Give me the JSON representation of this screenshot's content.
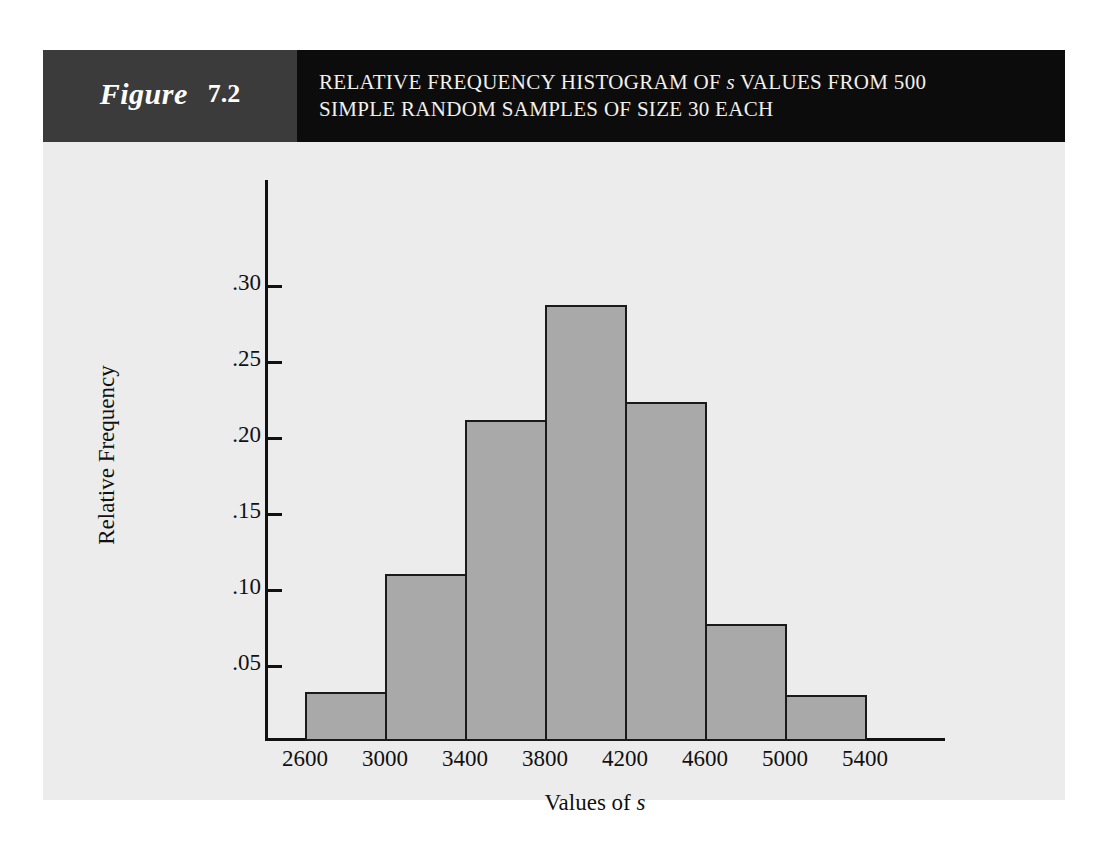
{
  "figure": {
    "label_word": "Figure",
    "number": "7.2",
    "title_line1_pre": "RELATIVE FREQUENCY HISTOGRAM OF ",
    "title_line1_em": "s",
    "title_line1_post": " VALUES FROM 500",
    "title_line2": "SIMPLE RANDOM SAMPLES OF SIZE 30 EACH"
  },
  "colors": {
    "panel_bg": "#ececec",
    "label_block": "#3c3b3b",
    "title_block": "#0d0c0c",
    "bar_fill": "#a9a9a9",
    "bar_stroke": "#1a1a1a",
    "axis": "#111111"
  },
  "axis_titles": {
    "y": "Relative Frequency",
    "x_pre": "Values of ",
    "x_em": "s"
  },
  "chart_data": {
    "type": "bar",
    "title": "RELATIVE FREQUENCY HISTOGRAM OF s VALUES FROM 500 SIMPLE RANDOM SAMPLES OF SIZE 30 EACH",
    "xlabel": "Values of s",
    "ylabel": "Relative Frequency",
    "histogram": true,
    "bin_width": 400,
    "bin_edges": [
      2600,
      3000,
      3400,
      3800,
      4200,
      4600,
      5000,
      5400
    ],
    "categories": [
      "2600-3000",
      "3000-3400",
      "3400-3800",
      "3800-4200",
      "4200-4600",
      "4600-5000",
      "5000-5400"
    ],
    "values": [
      0.032,
      0.11,
      0.211,
      0.287,
      0.223,
      0.077,
      0.03
    ],
    "xticks": [
      2600,
      3000,
      3400,
      3800,
      4200,
      4600,
      5000,
      5400
    ],
    "xtick_labels": [
      "2600",
      "3000",
      "3400",
      "3800",
      "4200",
      "4600",
      "5000",
      "5400"
    ],
    "yticks": [
      0.05,
      0.1,
      0.15,
      0.2,
      0.25,
      0.3
    ],
    "ytick_labels": [
      ".05",
      ".10",
      ".15",
      ".20",
      ".25",
      ".30"
    ],
    "xlim": [
      2400,
      5800
    ],
    "ylim": [
      0,
      0.325
    ],
    "grid": false,
    "legend": false
  }
}
